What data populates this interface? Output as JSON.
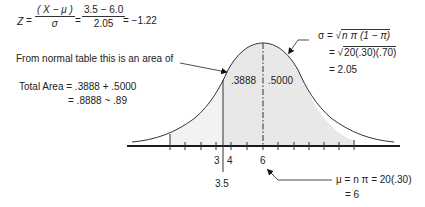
{
  "formula_z": {
    "lhs": "Z",
    "eq1": "=",
    "frac1_num": "( X − μ )",
    "frac1_den": "σ",
    "eq2": "=",
    "frac2_num": "3.5 − 6.0",
    "frac2_den": "2.05",
    "result": "= −1.22"
  },
  "normal_table_note": "From normal table this is an area of",
  "total_area": {
    "line1": "Total Area = .3888 + .5000",
    "line2": "= .8888  ~  .89"
  },
  "sigma": {
    "line1_prefix": "σ  =  √",
    "line1_radicand": "n π (1 − π)",
    "line2_prefix": "=  √",
    "line2_radicand": "20(.30)(.70)",
    "line3": "= 2.05"
  },
  "areas": {
    "left": ".3888",
    "right": ".5000"
  },
  "axis_labels": {
    "three": "3",
    "four": "4",
    "six": "6",
    "three_point_five": "3.5"
  },
  "mu": {
    "line1": "μ  =  n π  =  20(.30)",
    "line2": "= 6"
  },
  "colors": {
    "curve": "#333333",
    "shade": "#e6e6e6",
    "axis": "#1a1a1a"
  }
}
